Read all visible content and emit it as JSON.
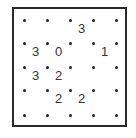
{
  "puzzle": {
    "type": "slitherlink",
    "rows": 4,
    "cols": 4,
    "clues": [
      [
        "",
        "",
        "3",
        ""
      ],
      [
        "3",
        "0",
        "",
        "1"
      ],
      [
        "3",
        "2",
        "",
        ""
      ],
      [
        "",
        "2",
        "2",
        ""
      ]
    ]
  }
}
